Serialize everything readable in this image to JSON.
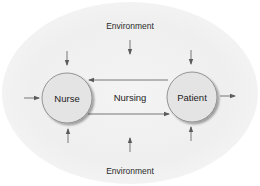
{
  "diagram": {
    "type": "nursing-process-model",
    "environment_top_label": "Environment",
    "environment_bottom_label": "Environment",
    "nodes": [
      {
        "id": "nurse",
        "label": "Nurse",
        "cx": 67,
        "cy": 98,
        "r": 25
      },
      {
        "id": "patient",
        "label": "Patient",
        "cx": 192,
        "cy": 97,
        "r": 25
      }
    ],
    "center_label": "Nursing",
    "edges": [
      {
        "from": "patient",
        "to": "nurse",
        "label": "",
        "direction": "right-to-left",
        "y": 80
      },
      {
        "from": "nurse",
        "to": "patient",
        "label": "",
        "direction": "left-to-right",
        "y": 114
      }
    ],
    "environment_arrows": [
      {
        "position": "top-center",
        "direction": "down"
      },
      {
        "position": "above-nurse",
        "direction": "down"
      },
      {
        "position": "above-patient",
        "direction": "down"
      },
      {
        "position": "below-nurse",
        "direction": "up"
      },
      {
        "position": "below-center",
        "direction": "up"
      },
      {
        "position": "below-patient",
        "direction": "up"
      },
      {
        "position": "left-of-nurse",
        "direction": "right"
      },
      {
        "position": "right-of-patient",
        "direction": "right"
      }
    ],
    "colors": {
      "node_fill": "#e4e4e4",
      "node_stroke": "#8a8a8a",
      "line": "#6a6a6a",
      "environment": "#f0f0f0",
      "text": "#2a2a2a"
    }
  }
}
